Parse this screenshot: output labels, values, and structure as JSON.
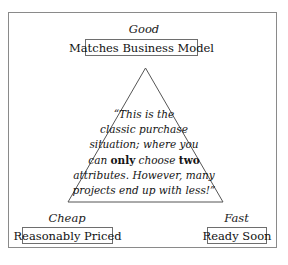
{
  "figure": {
    "background_color": "#ffffff",
    "frame_color": "#8a8a8a",
    "line_color": "#555555",
    "text_color": "#141414"
  },
  "corners": {
    "top": {
      "label": "Good",
      "value": "Matches Business Model"
    },
    "bottom_left": {
      "label": "Cheap",
      "value": "Reasonably Priced"
    },
    "bottom_right": {
      "label": "Fast",
      "value": "Ready Soon"
    }
  },
  "quote": {
    "lines": [
      "“This is the",
      "classic purchase",
      "situation; where you",
      "attributes. However, many",
      "projects end up with less!”"
    ],
    "line4": {
      "part1": "can ",
      "emph1": "only",
      "part2": " choose ",
      "emph2": "two"
    },
    "full_text": "“This is the classic purchase situation; where you can only choose two attributes. However, many projects end up with less!”"
  }
}
